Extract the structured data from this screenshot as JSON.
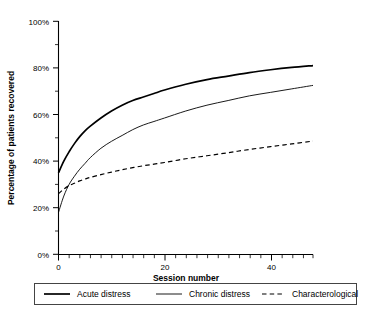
{
  "chart_data": {
    "type": "line",
    "title": "",
    "xlabel": "Session number",
    "ylabel": "Percentage of patients recovered",
    "xlim": [
      0,
      48
    ],
    "ylim": [
      0,
      100
    ],
    "xticks": [
      0,
      20,
      40
    ],
    "xtick_labels": [
      "0",
      "20",
      "40"
    ],
    "yticks": [
      0,
      20,
      40,
      60,
      80,
      100
    ],
    "ytick_labels": [
      "0%",
      "20%",
      "40%",
      "60%",
      "80%",
      "100%"
    ],
    "x_minor_tick_step": 2,
    "y_minor_tick_step": 5,
    "grid": false,
    "legend_position": "below",
    "x": [
      0,
      1,
      2,
      3,
      4,
      5,
      6,
      8,
      10,
      12,
      14,
      16,
      18,
      20,
      24,
      28,
      32,
      36,
      40,
      44,
      48
    ],
    "series": [
      {
        "name": "Acute distress",
        "style": "solid-thick",
        "values": [
          35,
          40,
          44,
          47.5,
          50.5,
          53,
          55,
          58.5,
          61.5,
          64,
          66,
          67.5,
          69,
          70.5,
          73,
          75,
          76.5,
          78,
          79.2,
          80.2,
          81
        ]
      },
      {
        "name": "Chronic distress",
        "style": "solid-thin",
        "values": [
          18,
          25,
          30,
          33.5,
          36.5,
          39,
          41.5,
          45.5,
          48.5,
          51,
          53.5,
          55.5,
          57,
          58.5,
          61.5,
          64,
          66,
          68,
          69.5,
          71,
          72.5
        ]
      },
      {
        "name": "Characterological",
        "style": "dashed",
        "values": [
          26,
          28,
          29.5,
          30.5,
          31.5,
          32.3,
          33,
          34.2,
          35.3,
          36.3,
          37.2,
          38,
          38.7,
          39.4,
          41,
          42.3,
          43.6,
          45,
          46.2,
          47.4,
          48.6
        ]
      }
    ]
  },
  "legend": {
    "items": [
      {
        "label": "Acute distress"
      },
      {
        "label": "Chronic distress"
      },
      {
        "label": "Characterological"
      }
    ]
  },
  "colors": {
    "axis": "#000000",
    "series_acute": "#000000",
    "series_chronic": "#000000",
    "series_characterological": "#000000",
    "legend_border": "#444444",
    "background": "#ffffff"
  }
}
